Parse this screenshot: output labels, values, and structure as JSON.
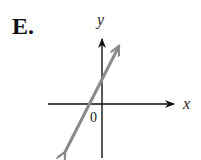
{
  "option": {
    "label": "E."
  },
  "graph": {
    "x_axis_label": "x",
    "y_axis_label": "y",
    "origin_label": "0",
    "axis_color": "#111111",
    "line_color": "#8a8a8a",
    "line_description": "line with positive slope, positive y-intercept, negative x-intercept"
  }
}
